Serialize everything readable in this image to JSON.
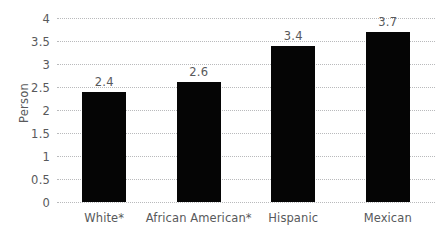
{
  "chart_data": {
    "type": "bar",
    "title": "",
    "subtitle": "",
    "xlabel": "",
    "ylabel": "Person",
    "categories": [
      "White*",
      "African American*",
      "Hispanic",
      "Mexican"
    ],
    "values": [
      2.4,
      2.6,
      3.4,
      3.7
    ],
    "value_labels": [
      "2.4",
      "2.6",
      "3.4",
      "3.7"
    ],
    "ylim": [
      0,
      4
    ],
    "ytick_values": [
      0,
      0.5,
      1,
      1.5,
      2,
      2.5,
      3,
      3.5,
      4
    ],
    "ytick_labels": [
      "0",
      "0.5",
      "1",
      "1.5",
      "2",
      "2.5",
      "3",
      "3.5",
      "4"
    ],
    "grid": true,
    "grid_axis": "y",
    "grid_style": "dotted",
    "legend": false,
    "legend_position": "none",
    "bar_color": "#050505",
    "grid_color": "#b9babc",
    "text_color": "#58595b",
    "background_color": "#ffffff",
    "series": [
      {
        "name": "Person",
        "values": [
          2.4,
          2.6,
          3.4,
          3.7
        ]
      }
    ]
  }
}
